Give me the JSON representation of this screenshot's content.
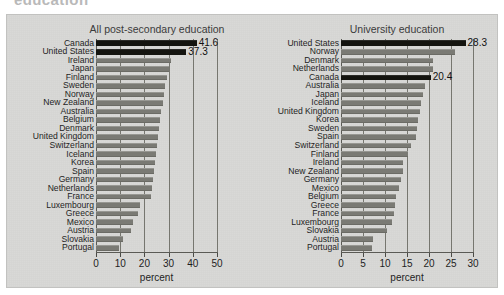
{
  "figure": {
    "cropped_headline": "education",
    "background_color": "#d9d9d7",
    "bar_color": "#7a7a74",
    "highlight_color": "#14140f"
  },
  "chart_data": [
    {
      "type": "bar",
      "orientation": "horizontal",
      "title": "All post-secondary education",
      "xlabel": "percent",
      "ylabel": "",
      "xlim": [
        0,
        50
      ],
      "xticks": [
        0,
        10,
        20,
        30,
        40,
        50
      ],
      "grid": true,
      "legend": "none",
      "highlighted": [
        "Canada",
        "United States"
      ],
      "data_labels": {
        "Canada": "41.6",
        "United States": "37.3"
      },
      "categories": [
        "Canada",
        "United States",
        "Ireland",
        "Japan",
        "Finland",
        "Sweden",
        "Norway",
        "New Zealand",
        "Australia",
        "Belgium",
        "Denmark",
        "United Kingdom",
        "Switzerland",
        "Iceland",
        "Korea",
        "Spain",
        "Germany",
        "Netherlands",
        "France",
        "Luxembourg",
        "Greece",
        "Mexico",
        "Austria",
        "Slovakia",
        "Portugal"
      ],
      "values": [
        41.6,
        37.3,
        31.0,
        30.2,
        29.4,
        28.6,
        28.2,
        27.6,
        27.0,
        26.6,
        26.2,
        25.8,
        25.4,
        24.8,
        24.2,
        23.8,
        23.4,
        23.0,
        22.8,
        18.2,
        17.4,
        15.2,
        14.4,
        11.0,
        9.4
      ]
    },
    {
      "type": "bar",
      "orientation": "horizontal",
      "title": "University education",
      "xlabel": "percent",
      "ylabel": "",
      "xlim": [
        0,
        30
      ],
      "xticks": [
        0,
        5,
        10,
        15,
        20,
        25,
        30
      ],
      "grid": true,
      "legend": "none",
      "highlighted": [
        "United States",
        "Canada"
      ],
      "data_labels": {
        "United States": "28.3",
        "Canada": "20.4"
      },
      "categories": [
        "United States",
        "Norway",
        "Denmark",
        "Netherlands",
        "Canada",
        "Australia",
        "Japan",
        "Iceland",
        "United Kingdom",
        "Korea",
        "Sweden",
        "Spain",
        "Switzerland",
        "Finland",
        "Ireland",
        "New Zealand",
        "Germany",
        "Mexico",
        "Belgium",
        "Greece",
        "France",
        "Luxembourg",
        "Slovakia",
        "Austria",
        "Portugal"
      ],
      "values": [
        28.3,
        26.0,
        21.0,
        20.8,
        20.4,
        19.0,
        18.6,
        18.2,
        18.0,
        17.6,
        17.3,
        17.0,
        16.0,
        15.2,
        14.2,
        14.0,
        13.6,
        13.2,
        12.6,
        12.3,
        12.0,
        11.5,
        10.4,
        7.2,
        7.0
      ]
    }
  ]
}
